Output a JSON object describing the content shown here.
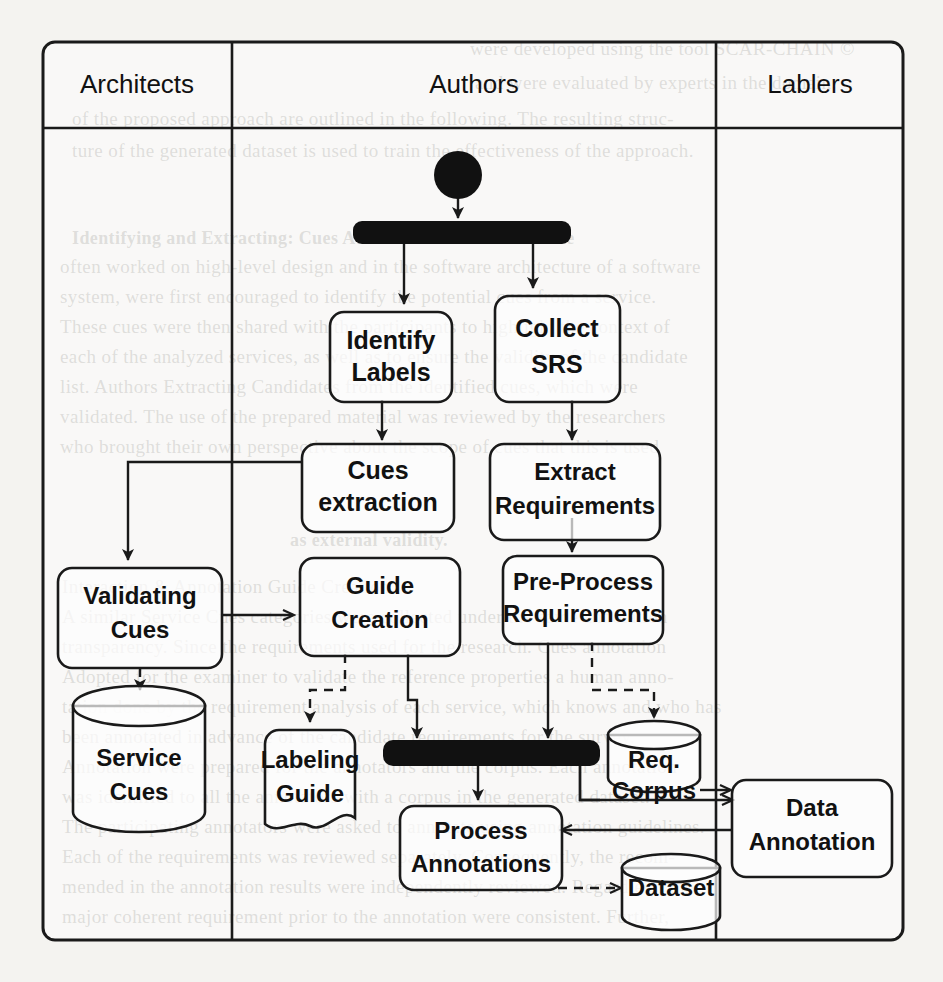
{
  "diagram": {
    "type": "uml-activity-swimlane",
    "colors": {
      "line": "#1a1a1a",
      "fill": "#ffffff",
      "bar": "#111111",
      "page": "#f4f3f0"
    },
    "lanes": [
      {
        "id": "architects",
        "label": "Architects"
      },
      {
        "id": "authors",
        "label": "Authors"
      },
      {
        "id": "lablers",
        "label": "Lablers"
      }
    ],
    "nodes": [
      {
        "id": "start",
        "kind": "initial-node",
        "lane": "authors",
        "label": ""
      },
      {
        "id": "fork",
        "kind": "fork-bar",
        "lane": "authors",
        "label": ""
      },
      {
        "id": "identify-labels",
        "kind": "action",
        "lane": "authors",
        "label": "Identify Labels"
      },
      {
        "id": "collect-srs",
        "kind": "action",
        "lane": "authors",
        "label": "Collect SRS"
      },
      {
        "id": "cues-extraction",
        "kind": "action",
        "lane": "authors",
        "label": "Cues extraction"
      },
      {
        "id": "extract-requirements",
        "kind": "action",
        "lane": "authors",
        "label": "Extract Requirements"
      },
      {
        "id": "validating-cues",
        "kind": "action",
        "lane": "architects",
        "label": "Validating Cues"
      },
      {
        "id": "guide-creation",
        "kind": "action",
        "lane": "authors",
        "label": "Guide Creation"
      },
      {
        "id": "pre-process-req",
        "kind": "action",
        "lane": "authors",
        "label": "Pre-Process Requirements"
      },
      {
        "id": "service-cues",
        "kind": "datastore",
        "lane": "architects",
        "label": "Service Cues"
      },
      {
        "id": "labeling-guide",
        "kind": "document",
        "lane": "authors",
        "label": "Labeling Guide"
      },
      {
        "id": "join",
        "kind": "join-bar",
        "lane": "authors",
        "label": ""
      },
      {
        "id": "req-corpus",
        "kind": "datastore",
        "lane": "authors",
        "label": "Req. Corpus"
      },
      {
        "id": "data-annotation",
        "kind": "action",
        "lane": "lablers",
        "label": "Data Annotation"
      },
      {
        "id": "process-annotations",
        "kind": "action",
        "lane": "authors",
        "label": "Process Annotations"
      },
      {
        "id": "dataset",
        "kind": "datastore",
        "lane": "authors",
        "label": "Dataset"
      }
    ],
    "node_labels": {
      "identify_labels_1": "Identify",
      "identify_labels_2": "Labels",
      "collect_srs_1": "Collect",
      "collect_srs_2": "SRS",
      "cues_extraction_1": "Cues",
      "cues_extraction_2": "extraction",
      "extract_requirements_1": "Extract",
      "extract_requirements_2": "Requirements",
      "validating_cues_1": "Validating",
      "validating_cues_2": "Cues",
      "guide_creation_1": "Guide",
      "guide_creation_2": "Creation",
      "pre_process_1": "Pre-Process",
      "pre_process_2": "Requirements",
      "service_cues_1": "Service",
      "service_cues_2": "Cues",
      "labeling_guide_1": "Labeling",
      "labeling_guide_2": "Guide",
      "req_corpus_1": "Req.",
      "req_corpus_2": "Corpus",
      "data_annotation_1": "Data",
      "data_annotation_2": "Annotation",
      "process_annotations_1": "Process",
      "process_annotations_2": "Annotations",
      "dataset_1": "Dataset"
    },
    "edges": [
      {
        "from": "start",
        "to": "fork",
        "style": "solid"
      },
      {
        "from": "fork",
        "to": "identify-labels",
        "style": "solid"
      },
      {
        "from": "fork",
        "to": "collect-srs",
        "style": "solid"
      },
      {
        "from": "identify-labels",
        "to": "cues-extraction",
        "style": "solid"
      },
      {
        "from": "collect-srs",
        "to": "extract-requirements",
        "style": "solid"
      },
      {
        "from": "cues-extraction",
        "to": "validating-cues",
        "style": "solid"
      },
      {
        "from": "extract-requirements",
        "to": "pre-process-req",
        "style": "solid"
      },
      {
        "from": "validating-cues",
        "to": "guide-creation",
        "style": "solid"
      },
      {
        "from": "validating-cues",
        "to": "service-cues",
        "style": "dashed"
      },
      {
        "from": "guide-creation",
        "to": "labeling-guide",
        "style": "dashed"
      },
      {
        "from": "guide-creation",
        "to": "join",
        "style": "solid"
      },
      {
        "from": "pre-process-req",
        "to": "join",
        "style": "solid"
      },
      {
        "from": "pre-process-req",
        "to": "req-corpus",
        "style": "dashed"
      },
      {
        "from": "join",
        "to": "process-annotations",
        "style": "solid"
      },
      {
        "from": "join",
        "to": "data-annotation",
        "style": "solid"
      },
      {
        "from": "req-corpus",
        "to": "data-annotation",
        "style": "solid"
      },
      {
        "from": "data-annotation",
        "to": "process-annotations",
        "style": "solid"
      },
      {
        "from": "process-annotations",
        "to": "dataset",
        "style": "dashed"
      }
    ]
  },
  "background_text": {
    "lines": [
      "were developed using the tool SCAR-CHAIN ©",
      "and were evaluated by experts in the domain.",
      "of the proposed approach are outlined in the following. The resulting struc-",
      "ture of the generated dataset is used to train the effectiveness of the approach.",
      "Identifying and Extracting: Cues  Authors  Architects  that  have",
      "often worked on high-level design and in the software architecture of a software",
      "system, were first encouraged to identify the potential  cues  from a service.",
      "These cues were then shared with the participants to highlight the context of",
      "each of the analyzed services, as well as to ensure the validity of the candidate",
      "list. Authors  Extracting  Candidates  from the identified cues, which were",
      "validated. The use of the prepared material was reviewed by the researchers",
      "who brought their own perspective about the scope of cues that this is used",
      "as external validity.",
      "Interaction & Annotation Guide Creation",
      "A similar Service Cues categories were collected under the same annotation",
      "transparency. Since the requirements used for the research. Cues  annotation",
      "Adopted for the examiner to validate the reference properties a human anno-",
      "tation done by the requirement analysis of each service, which knows and who has",
      "been annotated in advance of the candidate requirements for the survey.",
      "Annotation were prepared for the annotators and the corpus. Each annotation",
      "was identified to all the annotators with a corpus in the generated dataset.",
      "The participating annotators were asked to annotate using annotation guidelines.",
      "Each of the requirements was reviewed separately. Consequently, the recom-",
      "mended in the annotation results were independently reviewed. Regardless, the",
      "major coherent requirement prior to the annotation were consistent. Further,",
      "a second reviewer reviewed the remaining does a set in the annotation process"
    ]
  }
}
